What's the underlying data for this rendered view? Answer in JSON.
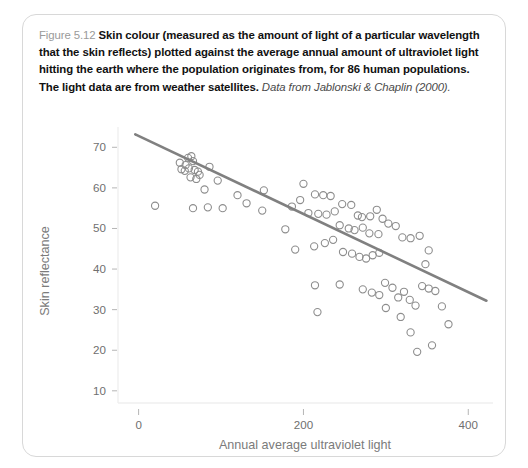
{
  "figure": {
    "label": "Figure 5.12",
    "caption": "Skin colour (measured as the amount of light of a particular wavelength that the skin reflects) plotted against the average annual amount of ultraviolet light hitting the earth where the population originates from, for 86 human populations. The light data are from weather satellites.",
    "source": "Data from Jablonski & Chaplin (2000).",
    "colors": {
      "card_border": "#d8d8d8",
      "caption_label": "#9a9a9a",
      "caption_text": "#111111",
      "point_stroke": "#8d8d8d",
      "trend_line": "#808080",
      "axis_text": "#7b7b7b",
      "tick_text": "#6f6f6f"
    }
  },
  "chart_data": {
    "type": "scatter",
    "title": "",
    "xlabel": "Annual average ultraviolet light",
    "ylabel": "Skin reflectance",
    "xlim": [
      -25,
      430
    ],
    "ylim": [
      7,
      75
    ],
    "xticks": [
      0,
      200,
      400
    ],
    "yticks": [
      10,
      20,
      30,
      40,
      50,
      60,
      70
    ],
    "grid": false,
    "legend": null,
    "n_points": 86,
    "marker": "open-circle",
    "trend_line": {
      "type": "linear-fit",
      "x": [
        -4,
        422
      ],
      "y": [
        73.2,
        32.2
      ]
    },
    "points": [
      [
        20,
        55.6
      ],
      [
        50,
        66.2
      ],
      [
        57,
        65.6
      ],
      [
        60,
        67.4
      ],
      [
        64,
        67.8
      ],
      [
        66,
        66.6
      ],
      [
        52,
        64.6
      ],
      [
        56,
        64.2
      ],
      [
        61,
        64.8
      ],
      [
        68,
        64.4
      ],
      [
        72,
        64.0
      ],
      [
        63,
        62.6
      ],
      [
        70,
        62.2
      ],
      [
        74,
        63.2
      ],
      [
        86,
        65.2
      ],
      [
        80,
        59.6
      ],
      [
        96,
        61.8
      ],
      [
        66,
        55.0
      ],
      [
        84,
        55.2
      ],
      [
        102,
        55.0
      ],
      [
        120,
        58.2
      ],
      [
        152,
        59.4
      ],
      [
        131,
        56.2
      ],
      [
        150,
        54.4
      ],
      [
        200,
        61.0
      ],
      [
        196,
        57.0
      ],
      [
        214,
        58.4
      ],
      [
        224,
        58.2
      ],
      [
        233,
        58.0
      ],
      [
        186,
        55.4
      ],
      [
        206,
        53.8
      ],
      [
        218,
        53.6
      ],
      [
        228,
        53.4
      ],
      [
        238,
        54.2
      ],
      [
        247,
        56.0
      ],
      [
        258,
        55.8
      ],
      [
        266,
        53.2
      ],
      [
        271,
        52.8
      ],
      [
        281,
        53.0
      ],
      [
        289,
        54.6
      ],
      [
        296,
        52.4
      ],
      [
        244,
        50.8
      ],
      [
        255,
        50.0
      ],
      [
        262,
        49.6
      ],
      [
        272,
        50.2
      ],
      [
        280,
        48.8
      ],
      [
        291,
        48.6
      ],
      [
        303,
        51.2
      ],
      [
        312,
        50.6
      ],
      [
        320,
        47.8
      ],
      [
        330,
        47.6
      ],
      [
        341,
        48.2
      ],
      [
        352,
        44.6
      ],
      [
        178,
        49.8
      ],
      [
        190,
        44.8
      ],
      [
        213,
        45.6
      ],
      [
        226,
        46.4
      ],
      [
        236,
        47.2
      ],
      [
        248,
        44.2
      ],
      [
        259,
        43.8
      ],
      [
        268,
        43.0
      ],
      [
        276,
        42.6
      ],
      [
        284,
        43.4
      ],
      [
        292,
        44.0
      ],
      [
        217,
        29.4
      ],
      [
        214,
        36.0
      ],
      [
        244,
        36.2
      ],
      [
        272,
        35.0
      ],
      [
        283,
        34.2
      ],
      [
        292,
        33.6
      ],
      [
        299,
        36.6
      ],
      [
        308,
        35.4
      ],
      [
        315,
        33.0
      ],
      [
        322,
        34.4
      ],
      [
        329,
        32.4
      ],
      [
        336,
        31.0
      ],
      [
        344,
        35.8
      ],
      [
        352,
        35.2
      ],
      [
        360,
        34.6
      ],
      [
        368,
        30.8
      ],
      [
        376,
        26.4
      ],
      [
        300,
        30.4
      ],
      [
        318,
        28.2
      ],
      [
        330,
        24.4
      ],
      [
        338,
        19.6
      ],
      [
        356,
        21.2
      ],
      [
        348,
        41.2
      ]
    ]
  }
}
